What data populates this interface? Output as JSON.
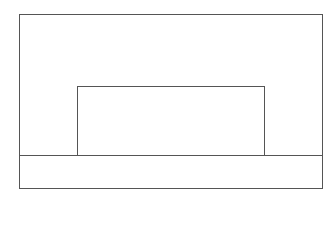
{
  "diagram": {
    "line_color": "#555555",
    "background": "#ffffff",
    "shapes": {
      "outer_rect": {
        "x": 19,
        "y": 14,
        "w": 304,
        "h": 175
      },
      "divider_line": {
        "x": 19,
        "y": 155,
        "w": 304
      },
      "inner_rect": {
        "x": 77,
        "y": 86,
        "w": 188,
        "h": 70
      }
    }
  }
}
